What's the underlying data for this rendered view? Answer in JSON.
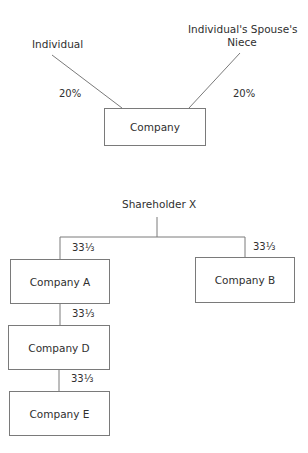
{
  "diagram1": {
    "nodes": {
      "individual": "Individual",
      "niece_line1": "Individual's Spouse's",
      "niece_line2": "Niece",
      "company": "Company"
    },
    "edges": {
      "individual_to_company": "20%",
      "niece_to_company": "20%"
    }
  },
  "diagram2": {
    "root": "Shareholder X",
    "nodes": {
      "company_a": "Company A",
      "company_b": "Company B",
      "company_d": "Company D",
      "company_e": "Company E"
    },
    "edges": {
      "x_to_a": "33⅓",
      "x_to_b": "33⅓",
      "a_to_d": "33⅓",
      "d_to_e": "33⅓"
    }
  },
  "colors": {
    "line": "#7a7a7a",
    "text": "#2f2f2f"
  }
}
